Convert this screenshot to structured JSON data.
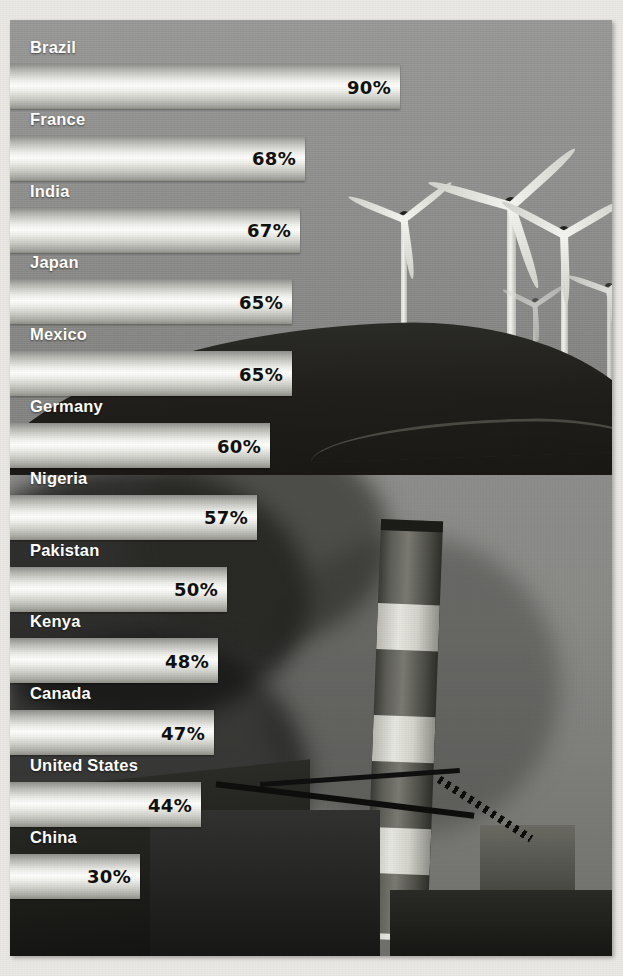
{
  "chart_data": {
    "type": "bar",
    "title": "",
    "xlabel": "",
    "ylabel": "",
    "orientation": "horizontal",
    "value_suffix": "%",
    "xlim": [
      0,
      100
    ],
    "grid": false,
    "legend": "none",
    "categories": [
      "Brazil",
      "France",
      "India",
      "Japan",
      "Mexico",
      "Germany",
      "Nigeria",
      "Pakistan",
      "Kenya",
      "Canada",
      "United States",
      "China"
    ],
    "values": [
      90,
      68,
      67,
      65,
      65,
      60,
      57,
      50,
      48,
      47,
      44,
      30
    ],
    "bars": [
      {
        "label": "Brazil",
        "value": 90,
        "value_label": "90%"
      },
      {
        "label": "France",
        "value": 68,
        "value_label": "68%"
      },
      {
        "label": "India",
        "value": 67,
        "value_label": "67%"
      },
      {
        "label": "Japan",
        "value": 65,
        "value_label": "65%"
      },
      {
        "label": "Mexico",
        "value": 65,
        "value_label": "65%"
      },
      {
        "label": "Germany",
        "value": 60,
        "value_label": "60%"
      },
      {
        "label": "Nigeria",
        "value": 57,
        "value_label": "57%"
      },
      {
        "label": "Pakistan",
        "value": 50,
        "value_label": "50%"
      },
      {
        "label": "Kenya",
        "value": 48,
        "value_label": "48%"
      },
      {
        "label": "Canada",
        "value": 47,
        "value_label": "47%"
      },
      {
        "label": "United States",
        "value": 44,
        "value_label": "44%"
      },
      {
        "label": "China",
        "value": 30,
        "value_label": "30%"
      }
    ]
  },
  "style": {
    "bar_fill_light": "#fdfdfb",
    "bar_fill_mid": "#d9d9d3",
    "bar_fill_dark": "#8e8e8a",
    "label_color": "#ffffff",
    "value_color": "#111110",
    "photo_sky": "#8f8f8d",
    "photo_ground": "#1b1b18"
  },
  "background": {
    "top_photo": "wind-turbines-on-ridge",
    "bottom_photo": "smokestack-power-plant-with-smoke"
  }
}
